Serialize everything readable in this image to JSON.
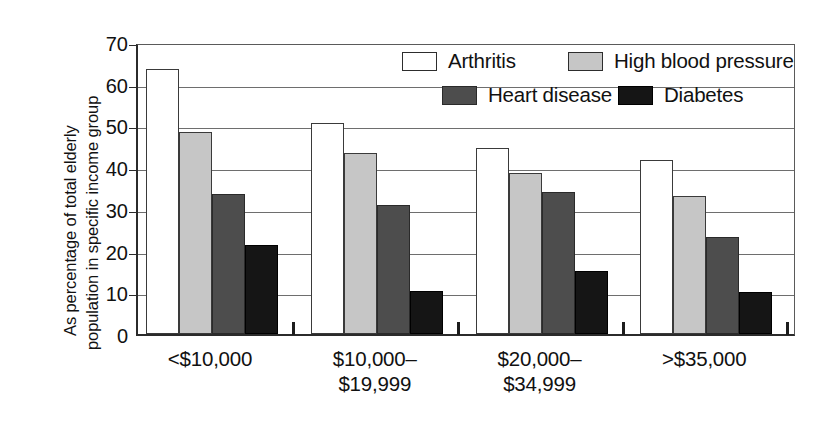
{
  "chart_data": {
    "type": "bar",
    "title": "",
    "subtitle": "",
    "xlabel": "",
    "ylabel": "As percentage of total elderly population in specific income group",
    "ylabel_lines": [
      "As percentage of total elderly",
      "population in specific income group"
    ],
    "ylim": [
      0,
      70
    ],
    "ytick_values": [
      0,
      10,
      20,
      30,
      40,
      50,
      60,
      70
    ],
    "ytick_labels": [
      "0",
      "10",
      "20",
      "30",
      "40",
      "50",
      "60",
      "70"
    ],
    "grid": true,
    "grid_axis": "y",
    "legend_position": "inside-top-right",
    "categories": [
      "<$10,000",
      "$10,000–$19,999",
      "$20,000–$34,999",
      ">$35,000"
    ],
    "category_lines": [
      [
        "<$10,000"
      ],
      [
        "$10,000–",
        "$19,999"
      ],
      [
        "$20,000–",
        "$34,999"
      ],
      [
        ">$35,000"
      ]
    ],
    "series": [
      {
        "name": "Arthritis",
        "color": "#ffffff",
        "values": [
          63.5,
          50.5,
          44.5,
          41.7
        ]
      },
      {
        "name": "High blood pressure",
        "color": "#c6c6c6",
        "values": [
          48.5,
          43.5,
          38.5,
          33.0
        ]
      },
      {
        "name": "Heart disease",
        "color": "#4d4d4d",
        "values": [
          33.5,
          31.0,
          34.0,
          23.3
        ]
      },
      {
        "name": "Diabetes",
        "color": "#151515",
        "values": [
          21.3,
          10.3,
          15.0,
          10.0
        ]
      }
    ]
  },
  "legend": {
    "entries": [
      {
        "label": "Arthritis"
      },
      {
        "label": "High blood pressure"
      },
      {
        "label": "Heart disease"
      },
      {
        "label": "Diabetes"
      }
    ]
  }
}
